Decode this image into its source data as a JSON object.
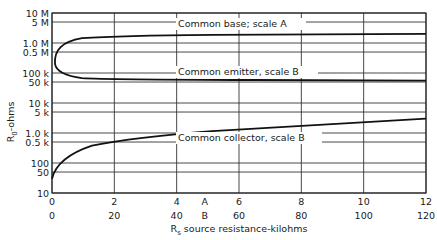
{
  "chart_data": {
    "type": "line",
    "title": "",
    "xlabel": "R_s source resistance-kilohms",
    "ylabel": "R_0-ohms",
    "y_scale": "log",
    "ylim": [
      10,
      10000000
    ],
    "xlim_scale_A": [
      0,
      12
    ],
    "xlim_scale_B": [
      0,
      120
    ],
    "grid": true,
    "y_ticks": [
      {
        "value": 10000000,
        "label": "10 M"
      },
      {
        "value": 5000000,
        "label": "5 M"
      },
      {
        "value": 1000000,
        "label": "1.0 M"
      },
      {
        "value": 500000,
        "label": "0.5 M"
      },
      {
        "value": 100000,
        "label": "100 k"
      },
      {
        "value": 50000,
        "label": "50 k"
      },
      {
        "value": 10000,
        "label": "10 k"
      },
      {
        "value": 5000,
        "label": "5 k"
      },
      {
        "value": 1000,
        "label": "1.0 k"
      },
      {
        "value": 500,
        "label": "0.5 k"
      },
      {
        "value": 100,
        "label": "100"
      },
      {
        "value": 50,
        "label": "50"
      },
      {
        "value": 10,
        "label": "10"
      }
    ],
    "x_ticks_A": [
      "0",
      "2",
      "4",
      "6",
      "8",
      "10",
      "12"
    ],
    "x_ticks_B": [
      "0",
      "20",
      "40",
      "60",
      "80",
      "100",
      "120"
    ],
    "scale_labels": {
      "A": "A",
      "B": "B"
    },
    "series": [
      {
        "name": "Common base; scale A",
        "scale": "A",
        "x": [
          0,
          0.1,
          0.25,
          0.5,
          1,
          2,
          4,
          6,
          8,
          10,
          12
        ],
        "values": [
          200000,
          400000,
          700000,
          1000000,
          1400000,
          1700000,
          1850000,
          1900000,
          1950000,
          2000000,
          2000000
        ]
      },
      {
        "name": "Common emitter, scale B",
        "scale": "B",
        "x": [
          0,
          1,
          2.5,
          5,
          10,
          20,
          40,
          60,
          80,
          100,
          120
        ],
        "values": [
          200000,
          120000,
          85000,
          68000,
          62000,
          60000,
          59000,
          58000,
          57000,
          56000,
          55000
        ]
      },
      {
        "name": "Common collector, scale B",
        "scale": "B",
        "x": [
          0,
          1,
          2.5,
          5,
          10,
          20,
          40,
          60,
          80,
          100,
          120
        ],
        "values": [
          30,
          70,
          120,
          200,
          320,
          600,
          1100,
          1600,
          2100,
          2600,
          3100
        ]
      }
    ],
    "annotations": [
      "Common base; scale A",
      "Common emitter, scale B",
      "Common collector, scale B"
    ]
  },
  "labels": {
    "ylabel_main": "R",
    "ylabel_sub": "0",
    "ylabel_rest": "-ohms",
    "xlabel_main": "R",
    "xlabel_sub": "s",
    "xlabel_rest": " source resistance-kilohms",
    "curve_base": "Common base; scale A",
    "curve_emitter": "Common emitter, scale B",
    "curve_collector": "Common collector, scale B"
  }
}
